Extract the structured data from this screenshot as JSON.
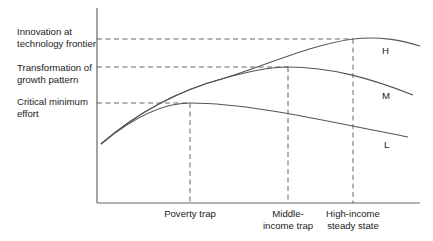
{
  "diagram": {
    "y_levels": [
      {
        "id": "innovation",
        "label_line1": "Innovation at",
        "label_line2": "technology frontier",
        "y": 39
      },
      {
        "id": "transformation",
        "label_line1": "Transformation of",
        "label_line2": "growth pattern",
        "y": 67
      },
      {
        "id": "critical",
        "label_line1": "Critical minimum",
        "label_line2": "effort",
        "y": 103
      }
    ],
    "x_markers": [
      {
        "id": "poverty-trap",
        "label_line1": "Poverty trap",
        "label_line2": "",
        "x": 190
      },
      {
        "id": "middle-income-trap",
        "label_line1": "Middle-",
        "label_line2": "income trap",
        "x": 288
      },
      {
        "id": "high-income-steady-state",
        "label_line1": "High-income",
        "label_line2": "steady state",
        "x": 353
      }
    ],
    "curves": [
      {
        "id": "H",
        "label": "H"
      },
      {
        "id": "M",
        "label": "M"
      },
      {
        "id": "L",
        "label": "L"
      }
    ],
    "colors": {
      "line": "#555555",
      "axis": "#666666",
      "text": "#222222"
    }
  }
}
